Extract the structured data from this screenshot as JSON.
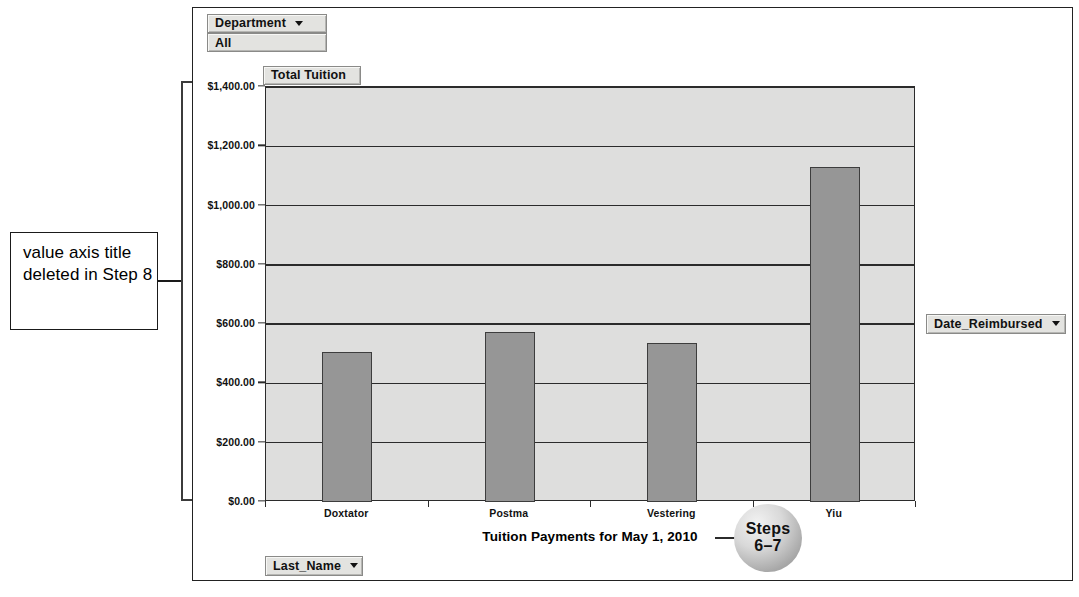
{
  "annotation": {
    "text": "value axis title deleted in Step 8"
  },
  "pivot_fields": {
    "department_label": "Department",
    "department_value": "All",
    "total_tuition_label": "Total Tuition",
    "last_name_label": "Last_Name",
    "date_reimbursed_label": "Date_Reimbursed"
  },
  "callout": {
    "line1": "Steps",
    "line2": "6–7"
  },
  "colors": {
    "bar_fill": "#969696",
    "bar_border": "#3d3d3d",
    "plot_background": "#dededd",
    "gridline": "#2b2b2b",
    "frame_border": "#222222",
    "field_button_background": "#e3e3e0"
  },
  "chart_data": {
    "type": "bar",
    "title": "Tuition Payments for May 1, 2010",
    "xlabel": "",
    "ylabel": "",
    "categories": [
      "Doxtator",
      "Postma",
      "Vestering",
      "Yiu"
    ],
    "values": [
      505,
      575,
      535,
      1130
    ],
    "ylim": [
      0,
      1400
    ],
    "ytick_values": [
      0,
      200,
      400,
      600,
      800,
      1000,
      1200,
      1400
    ],
    "ytick_labels": [
      "$0.00",
      "$200.00",
      "$400.00",
      "$600.00",
      "$800.00",
      "$1,000.00",
      "$1,200.00",
      "$1,400.00"
    ],
    "grid": true,
    "legend": false
  }
}
